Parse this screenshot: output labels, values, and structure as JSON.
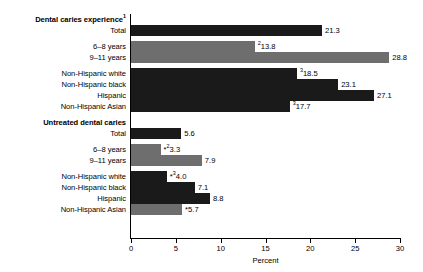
{
  "chart_data": {
    "type": "bar",
    "orientation": "horizontal",
    "title": "",
    "xlabel": "Percent",
    "ylabel": "",
    "xlim": [
      0,
      30
    ],
    "xticks": [
      0,
      5,
      10,
      15,
      20,
      25,
      30
    ],
    "grid": false,
    "legend": "none",
    "categories": [
      "Dental caries experience¹",
      "Total",
      "6–8 years",
      "9–11 years",
      "Non-Hispanic white",
      "Non-Hispanic black",
      "Hispanic",
      "Non-Hispanic Asian",
      "Untreated dental caries",
      "Total",
      "6–8 years",
      "9–11 years",
      "Non-Hispanic white",
      "Non-Hispanic black",
      "Hispanic",
      "Non-Hispanic Asian"
    ],
    "values": [
      null,
      21.3,
      13.8,
      28.8,
      18.5,
      23.1,
      27.1,
      17.7,
      null,
      5.6,
      3.3,
      7.9,
      4.0,
      7.1,
      8.8,
      5.7
    ],
    "value_labels": [
      null,
      "21.3",
      "13.8",
      "28.8",
      "18.5",
      "23.1",
      "27.1",
      "17.7",
      null,
      "5.6",
      "3.3",
      "7.9",
      "4.0",
      "7.1",
      "8.8",
      "5.7"
    ],
    "annotations": {
      "superscript_1": "Dental caries experience¹",
      "superscript_2": [
        "13.8",
        "3.3"
      ],
      "superscript_3": [
        "18.5",
        "17.7",
        "4.0"
      ],
      "asterisk": [
        "3.3",
        "4.0",
        "5.7"
      ]
    }
  },
  "rows": [
    {
      "label": "Dental caries experience",
      "sup": "1",
      "header": true,
      "bar": false,
      "value": null,
      "prefix": "",
      "sup_val": "",
      "color": ""
    },
    {
      "label": "Total",
      "sup": "",
      "header": false,
      "bar": true,
      "value": 21.3,
      "prefix": "",
      "sup_val": "",
      "color": "dark"
    },
    {
      "label": "6–8 years",
      "sup": "",
      "header": false,
      "bar": true,
      "value": 13.8,
      "prefix": "",
      "sup_val": "2",
      "color": "gray"
    },
    {
      "label": "9–11 years",
      "sup": "",
      "header": false,
      "bar": true,
      "value": 28.8,
      "prefix": "",
      "sup_val": "",
      "color": "gray"
    },
    {
      "label": "Non-Hispanic white",
      "sup": "",
      "header": false,
      "bar": true,
      "value": 18.5,
      "prefix": "",
      "sup_val": "3",
      "color": "dark"
    },
    {
      "label": "Non-Hispanic black",
      "sup": "",
      "header": false,
      "bar": true,
      "value": 23.1,
      "prefix": "",
      "sup_val": "",
      "color": "dark"
    },
    {
      "label": "Hispanic",
      "sup": "",
      "header": false,
      "bar": true,
      "value": 27.1,
      "prefix": "",
      "sup_val": "",
      "color": "dark"
    },
    {
      "label": "Non-Hispanic Asian",
      "sup": "",
      "header": false,
      "bar": true,
      "value": 17.7,
      "prefix": "",
      "sup_val": "3",
      "color": "dark"
    },
    {
      "label": "Untreated dental caries",
      "sup": "",
      "header": true,
      "bar": false,
      "value": null,
      "prefix": "",
      "sup_val": "",
      "color": ""
    },
    {
      "label": "Total",
      "sup": "",
      "header": false,
      "bar": true,
      "value": 5.6,
      "prefix": "",
      "sup_val": "",
      "color": "dark"
    },
    {
      "label": "6–8 years",
      "sup": "",
      "header": false,
      "bar": true,
      "value": 3.3,
      "prefix": "*",
      "sup_val": "2",
      "color": "gray"
    },
    {
      "label": "9–11 years",
      "sup": "",
      "header": false,
      "bar": true,
      "value": 7.9,
      "prefix": "",
      "sup_val": "",
      "color": "gray"
    },
    {
      "label": "Non-Hispanic white",
      "sup": "",
      "header": false,
      "bar": true,
      "value": 4.0,
      "prefix": "*",
      "sup_val": "3",
      "color": "dark"
    },
    {
      "label": "Non-Hispanic black",
      "sup": "",
      "header": false,
      "bar": true,
      "value": 7.1,
      "prefix": "",
      "sup_val": "",
      "color": "dark"
    },
    {
      "label": "Hispanic",
      "sup": "",
      "header": false,
      "bar": true,
      "value": 8.8,
      "prefix": "",
      "sup_val": "",
      "color": "dark"
    },
    {
      "label": "Non-Hispanic Asian",
      "sup": "",
      "header": false,
      "bar": true,
      "value": 5.7,
      "prefix": "*",
      "sup_val": "",
      "color": "gray"
    }
  ],
  "axis": {
    "title": "Percent",
    "ticks": [
      "0",
      "5",
      "10",
      "15",
      "20",
      "25",
      "30"
    ]
  }
}
